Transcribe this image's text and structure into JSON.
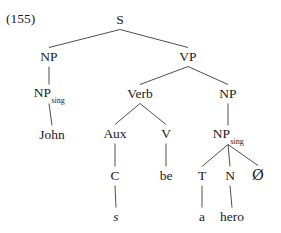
{
  "figure": {
    "example_number": "(155)",
    "line_color": "#3a3a3a",
    "text_color": "#1a1a1a",
    "background": "#ffffff"
  },
  "tree": {
    "nodes": {
      "s": {
        "label": "S",
        "x": 120,
        "y": 20
      },
      "np_subj": {
        "label": "NP",
        "x": 49,
        "y": 57
      },
      "vp": {
        "label": "VP",
        "x": 188,
        "y": 57
      },
      "np_sing_subj": {
        "label": "NP",
        "sub": "sing",
        "x": 49,
        "y": 94
      },
      "verb": {
        "label": "Verb",
        "x": 140,
        "y": 94
      },
      "np_obj": {
        "label": "NP",
        "x": 228,
        "y": 94
      },
      "aux": {
        "label": "Aux",
        "x": 115,
        "y": 134
      },
      "v": {
        "label": "V",
        "x": 166,
        "y": 134
      },
      "np_sing_obj": {
        "label": "NP",
        "sub": "sing",
        "x": 228,
        "y": 135
      },
      "c": {
        "label": "C",
        "x": 115,
        "y": 176
      },
      "t": {
        "label": "T",
        "x": 202,
        "y": 176
      },
      "n": {
        "label": "N",
        "x": 230,
        "y": 176
      },
      "null": {
        "label": "Ø",
        "x": 258,
        "y": 175
      }
    },
    "terminals": {
      "john": {
        "label": "John",
        "x": 52,
        "y": 135,
        "italic": false
      },
      "be": {
        "label": "be",
        "x": 166,
        "y": 176,
        "italic": false
      },
      "s_morpheme": {
        "label": "s",
        "x": 116,
        "y": 217,
        "italic": true
      },
      "a": {
        "label": "a",
        "x": 202,
        "y": 217,
        "italic": false
      },
      "hero": {
        "label": "hero",
        "x": 232,
        "y": 217,
        "italic": false
      }
    },
    "edges": [
      {
        "from": "s",
        "to": "np_subj"
      },
      {
        "from": "s",
        "to": "vp"
      },
      {
        "from": "np_subj",
        "to": "np_sing_subj"
      },
      {
        "from": "np_sing_subj",
        "to": "john"
      },
      {
        "from": "vp",
        "to": "verb"
      },
      {
        "from": "vp",
        "to": "np_obj"
      },
      {
        "from": "verb",
        "to": "aux"
      },
      {
        "from": "verb",
        "to": "v"
      },
      {
        "from": "aux",
        "to": "c"
      },
      {
        "from": "c",
        "to": "s_morpheme"
      },
      {
        "from": "v",
        "to": "be"
      },
      {
        "from": "np_obj",
        "to": "np_sing_obj"
      },
      {
        "from": "np_sing_obj",
        "to": "t"
      },
      {
        "from": "np_sing_obj",
        "to": "n"
      },
      {
        "from": "np_sing_obj",
        "to": "null"
      },
      {
        "from": "t",
        "to": "a"
      },
      {
        "from": "n",
        "to": "hero"
      }
    ]
  }
}
